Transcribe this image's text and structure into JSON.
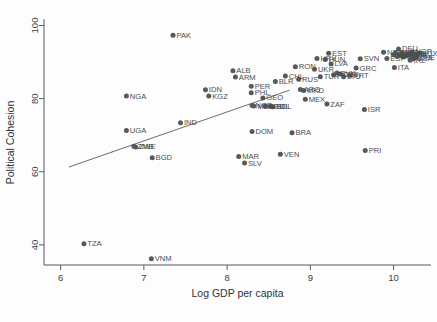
{
  "chart_data": {
    "type": "scatter",
    "title": "",
    "xlabel": "Log GDP per capita",
    "ylabel": "Political Cohesion",
    "xlim": [
      5.8,
      10.45
    ],
    "ylim": [
      34.5,
      101.5
    ],
    "xticks": [
      6,
      7,
      8,
      9,
      10
    ],
    "yticks": [
      40,
      60,
      80,
      100
    ],
    "grid": false,
    "legend": null,
    "marker_color": "#58595b",
    "fit_line": {
      "label": "linear fit",
      "x": [
        6.1,
        8.75
      ],
      "y": [
        61.3,
        82.3
      ]
    },
    "points": [
      {
        "label": "TZA",
        "x": 6.28,
        "y": 40.3
      },
      {
        "label": "VNM",
        "x": 7.09,
        "y": 36.2
      },
      {
        "label": "NGA",
        "x": 6.79,
        "y": 80.7
      },
      {
        "label": "UGA",
        "x": 6.79,
        "y": 71.3
      },
      {
        "label": "ZMB",
        "x": 6.88,
        "y": 67.0
      },
      {
        "label": "ZWE",
        "x": 6.9,
        "y": 66.8
      },
      {
        "label": "BGD",
        "x": 7.1,
        "y": 63.8
      },
      {
        "label": "PAK",
        "x": 7.35,
        "y": 97.3
      },
      {
        "label": "IND",
        "x": 7.44,
        "y": 73.4
      },
      {
        "label": "IDN",
        "x": 7.74,
        "y": 82.4
      },
      {
        "label": "KGZ",
        "x": 7.78,
        "y": 80.7
      },
      {
        "label": "ALB",
        "x": 8.07,
        "y": 87.6
      },
      {
        "label": "ARM",
        "x": 8.1,
        "y": 85.9
      },
      {
        "label": "MAR",
        "x": 8.14,
        "y": 64.2
      },
      {
        "label": "SLV",
        "x": 8.21,
        "y": 62.4
      },
      {
        "label": "PER",
        "x": 8.29,
        "y": 83.4
      },
      {
        "label": "PHL",
        "x": 8.29,
        "y": 81.6
      },
      {
        "label": "NGR",
        "x": 8.3,
        "y": 78.1
      },
      {
        "label": "MDA",
        "x": 8.32,
        "y": 78.0
      },
      {
        "label": "DOM",
        "x": 8.3,
        "y": 71.0
      },
      {
        "label": "GEO",
        "x": 8.43,
        "y": 80.2
      },
      {
        "label": "SRB",
        "x": 8.46,
        "y": 78.0
      },
      {
        "label": "COL",
        "x": 8.52,
        "y": 77.9
      },
      {
        "label": "BOL",
        "x": 8.55,
        "y": 77.8
      },
      {
        "label": "BLR",
        "x": 8.58,
        "y": 84.7
      },
      {
        "label": "VEN",
        "x": 8.64,
        "y": 64.8
      },
      {
        "label": "CHL",
        "x": 8.7,
        "y": 86.2
      },
      {
        "label": "BRA",
        "x": 8.78,
        "y": 70.7
      },
      {
        "label": "RON",
        "x": 8.82,
        "y": 88.7
      },
      {
        "label": "RUS",
        "x": 8.86,
        "y": 85.3
      },
      {
        "label": "ARG",
        "x": 8.88,
        "y": 82.5
      },
      {
        "label": "MKD",
        "x": 8.92,
        "y": 82.2
      },
      {
        "label": "MEX",
        "x": 8.94,
        "y": 79.8
      },
      {
        "label": "UKR",
        "x": 9.05,
        "y": 88.0
      },
      {
        "label": "HRV",
        "x": 9.08,
        "y": 91.0
      },
      {
        "label": "ZAF",
        "x": 9.2,
        "y": 78.5
      },
      {
        "label": "TUR",
        "x": 9.12,
        "y": 86.0
      },
      {
        "label": "HUN",
        "x": 9.18,
        "y": 90.7
      },
      {
        "label": "EST",
        "x": 9.22,
        "y": 92.4
      },
      {
        "label": "LVA",
        "x": 9.25,
        "y": 89.5
      },
      {
        "label": "POL",
        "x": 9.28,
        "y": 86.5
      },
      {
        "label": "SVK",
        "x": 9.32,
        "y": 87.0
      },
      {
        "label": "CZE",
        "x": 9.36,
        "y": 86.7
      },
      {
        "label": "LTU",
        "x": 9.4,
        "y": 86.0
      },
      {
        "label": "PRT",
        "x": 9.48,
        "y": 86.3
      },
      {
        "label": "GRC",
        "x": 9.55,
        "y": 88.4
      },
      {
        "label": "ISR",
        "x": 9.65,
        "y": 77.0
      },
      {
        "label": "PRI",
        "x": 9.66,
        "y": 65.8
      },
      {
        "label": "SVN",
        "x": 9.6,
        "y": 90.9
      },
      {
        "label": "NZL",
        "x": 9.88,
        "y": 92.7
      },
      {
        "label": "ESP",
        "x": 9.92,
        "y": 91.0
      },
      {
        "label": "ITA",
        "x": 10.01,
        "y": 88.5
      },
      {
        "label": "DEU",
        "x": 10.06,
        "y": 93.6
      },
      {
        "label": "JPN",
        "x": 10.02,
        "y": 92.5
      },
      {
        "label": "FRA",
        "x": 10.04,
        "y": 91.6
      },
      {
        "label": "GBR",
        "x": 10.08,
        "y": 91.8
      },
      {
        "label": "FIN",
        "x": 10.1,
        "y": 92.6
      },
      {
        "label": "BEL",
        "x": 10.12,
        "y": 91.4
      },
      {
        "label": "AUT",
        "x": 10.14,
        "y": 92.0
      },
      {
        "label": "SWE",
        "x": 10.16,
        "y": 91.9
      },
      {
        "label": "NLD",
        "x": 10.17,
        "y": 92.3
      },
      {
        "label": "DNK",
        "x": 10.19,
        "y": 92.1
      },
      {
        "label": "IRL",
        "x": 10.2,
        "y": 90.5
      },
      {
        "label": "USA",
        "x": 10.24,
        "y": 90.9
      },
      {
        "label": "CHE",
        "x": 10.27,
        "y": 91.3
      },
      {
        "label": "LUX",
        "x": 10.31,
        "y": 92.5
      },
      {
        "label": "NOR",
        "x": 10.22,
        "y": 92.8
      },
      {
        "label": "AUS",
        "x": 10.09,
        "y": 92.2
      },
      {
        "label": "CAN",
        "x": 10.05,
        "y": 91.9
      },
      {
        "label": "ISL",
        "x": 10.0,
        "y": 92.0
      }
    ],
    "labeled_points": [
      "TZA",
      "VNM",
      "NGA",
      "UGA",
      "ZMB",
      "ZWE",
      "BGD",
      "PAK",
      "IND",
      "IDN",
      "KGZ",
      "ALB",
      "ARM",
      "MAR",
      "SLV",
      "PER",
      "PHL",
      "NGR",
      "DOM",
      "GEO",
      "BOL",
      "BLR",
      "VEN",
      "CHL",
      "BRA",
      "RON",
      "MKD",
      "MEX",
      "UKR",
      "ZAF",
      "EST",
      "HUN",
      "GRC",
      "ISR",
      "PRI",
      "NZL",
      "ESP",
      "ITA",
      "DEU",
      "IRL",
      "LUX",
      "USA",
      "CHE"
    ]
  }
}
